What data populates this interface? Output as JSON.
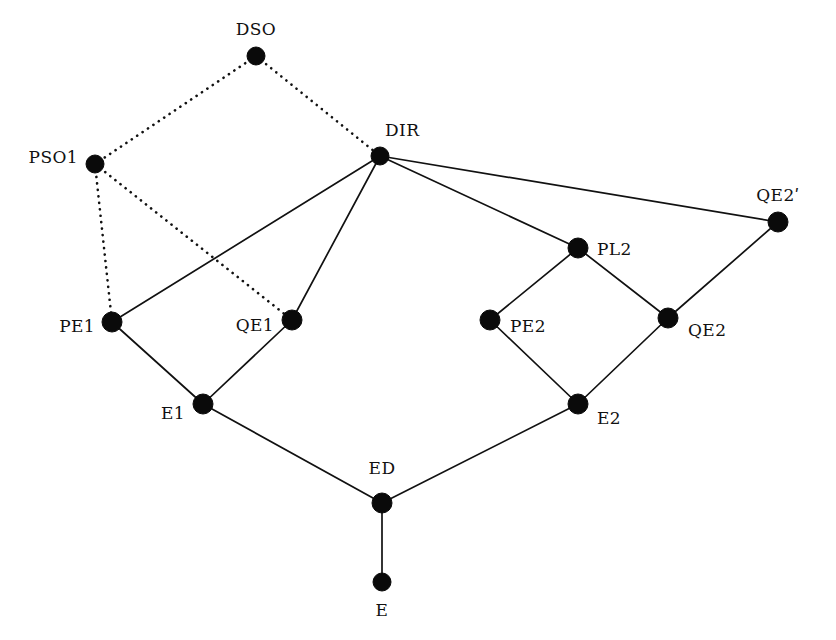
{
  "diagram": {
    "type": "lattice-hasse-diagram",
    "background_color": "#ffffff",
    "node_color": "#0a0a0a",
    "edge_color": "#111111",
    "nodes": [
      {
        "id": "DSO",
        "label": "DSO",
        "x": 256,
        "y": 56,
        "r": 9,
        "label_x": 256,
        "label_y": 38,
        "anchor": "s"
      },
      {
        "id": "PSO1",
        "label": "PSO1",
        "x": 95,
        "y": 164,
        "r": 9,
        "label_x": 78,
        "label_y": 157,
        "anchor": "e"
      },
      {
        "id": "DIR",
        "label": "DIR",
        "x": 380,
        "y": 156,
        "r": 9,
        "label_x": 385,
        "label_y": 139,
        "anchor": "sw"
      },
      {
        "id": "QE2P",
        "label": "QE2ʹ",
        "x": 778,
        "y": 222,
        "r": 10,
        "label_x": 778,
        "label_y": 204,
        "anchor": "s"
      },
      {
        "id": "PL2",
        "label": "PL2",
        "x": 578,
        "y": 248,
        "r": 10,
        "label_x": 597,
        "label_y": 249,
        "anchor": "w"
      },
      {
        "id": "PE1",
        "label": "PE1",
        "x": 112,
        "y": 322,
        "r": 10,
        "label_x": 95,
        "label_y": 326,
        "anchor": "e"
      },
      {
        "id": "QE1",
        "label": "QE1",
        "x": 292,
        "y": 320,
        "r": 10,
        "label_x": 274,
        "label_y": 325,
        "anchor": "e"
      },
      {
        "id": "PE2",
        "label": "PE2",
        "x": 490,
        "y": 320,
        "r": 10,
        "label_x": 510,
        "label_y": 326,
        "anchor": "w"
      },
      {
        "id": "QE2",
        "label": "QE2",
        "x": 668,
        "y": 318,
        "r": 10,
        "label_x": 688,
        "label_y": 330,
        "anchor": "w"
      },
      {
        "id": "E1",
        "label": "E1",
        "x": 203,
        "y": 404,
        "r": 10,
        "label_x": 185,
        "label_y": 413,
        "anchor": "e"
      },
      {
        "id": "E2",
        "label": "E2",
        "x": 578,
        "y": 404,
        "r": 10,
        "label_x": 597,
        "label_y": 418,
        "anchor": "w"
      },
      {
        "id": "ED",
        "label": "ED",
        "x": 382,
        "y": 503,
        "r": 10,
        "label_x": 382,
        "label_y": 477,
        "anchor": "s"
      },
      {
        "id": "E",
        "label": "E",
        "x": 382,
        "y": 582,
        "r": 9,
        "label_x": 382,
        "label_y": 602,
        "anchor": "n"
      }
    ],
    "edges": [
      {
        "from": "DSO",
        "to": "PSO1",
        "style": "dotted"
      },
      {
        "from": "DSO",
        "to": "DIR",
        "style": "dotted"
      },
      {
        "from": "PSO1",
        "to": "PE1",
        "style": "dotted"
      },
      {
        "from": "PSO1",
        "to": "QE1",
        "style": "dotted"
      },
      {
        "from": "DIR",
        "to": "PE1",
        "style": "solid"
      },
      {
        "from": "DIR",
        "to": "QE1",
        "style": "solid"
      },
      {
        "from": "DIR",
        "to": "PL2",
        "style": "solid"
      },
      {
        "from": "DIR",
        "to": "QE2P",
        "style": "solid"
      },
      {
        "from": "QE2P",
        "to": "QE2",
        "style": "solid"
      },
      {
        "from": "PL2",
        "to": "PE2",
        "style": "solid"
      },
      {
        "from": "PL2",
        "to": "QE2",
        "style": "solid"
      },
      {
        "from": "PE2",
        "to": "E2",
        "style": "solid"
      },
      {
        "from": "QE2",
        "to": "E2",
        "style": "solid"
      },
      {
        "from": "PE1",
        "to": "E1",
        "style": "solid"
      },
      {
        "from": "QE1",
        "to": "E1",
        "style": "solid"
      },
      {
        "from": "E1",
        "to": "ED",
        "style": "solid"
      },
      {
        "from": "E2",
        "to": "ED",
        "style": "solid"
      },
      {
        "from": "ED",
        "to": "E",
        "style": "solid"
      }
    ]
  }
}
